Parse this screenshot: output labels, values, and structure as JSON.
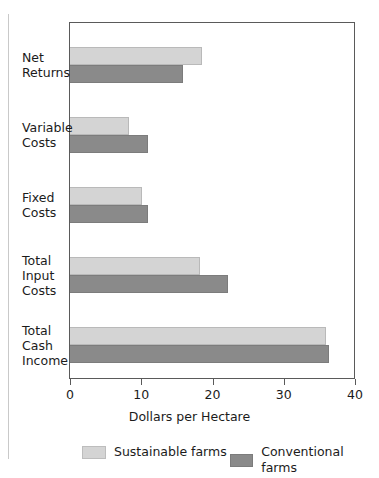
{
  "chart_data": {
    "type": "bar",
    "orientation": "horizontal",
    "title": "",
    "xlabel": "Dollars per Hectare",
    "ylabel": "",
    "xlim": [
      0,
      40
    ],
    "xticks": [
      0,
      10,
      20,
      30,
      40
    ],
    "xtick_labels": [
      "0",
      "10",
      "20",
      "30",
      "40"
    ],
    "grid": false,
    "legend_position": "bottom",
    "categories": [
      "Net Returns",
      "Variable Costs",
      "Fixed Costs",
      "Total Input Costs",
      "Total Cash Income"
    ],
    "category_label_lines": [
      [
        "Net",
        "Returns"
      ],
      [
        "Variable",
        "Costs"
      ],
      [
        "Fixed",
        "Costs"
      ],
      [
        "Total",
        "Input",
        "Costs"
      ],
      [
        "Total",
        "Cash",
        "Income"
      ]
    ],
    "series": [
      {
        "name": "Sustainable farms",
        "color": "#d4d4d4",
        "values": [
          18.5,
          8.3,
          10.1,
          18.2,
          35.9
        ]
      },
      {
        "name": "Conventional farms",
        "color": "#8a8a8a",
        "values": [
          15.8,
          11.0,
          11.0,
          22.2,
          36.3
        ]
      }
    ]
  },
  "axis": {
    "x_title": "Dollars per Hectare"
  },
  "legend": {
    "items": [
      {
        "label": "Sustainable farms",
        "swatch": "light-grey-swatch"
      },
      {
        "label": "Conventional farms",
        "swatch": "dark-grey-swatch"
      }
    ]
  }
}
